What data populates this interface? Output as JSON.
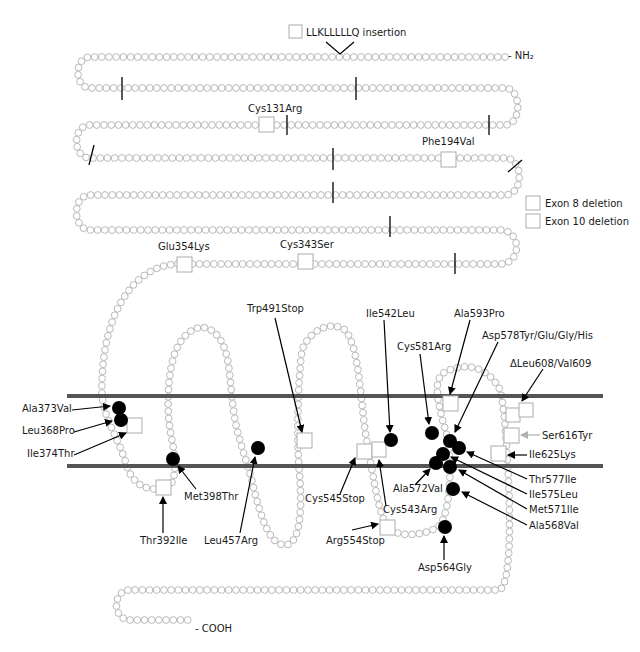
{
  "colors": {
    "bead_stroke": "#b9b9b9",
    "membrane": "#555555",
    "mutation_dot": "#000000",
    "gray_arrow": "#b0b0b0"
  },
  "termini": {
    "n_terminus": "- NH₂",
    "c_terminus": "- COOH"
  },
  "insertion": {
    "label": "LLKLLLLLQ insertion"
  },
  "legend": [
    {
      "label": "Exon 8 deletion"
    },
    {
      "label": "Exon 10 deletion"
    }
  ],
  "extracellular_labels": [
    {
      "label": "Cys131Arg",
      "x": 248,
      "y": 112
    },
    {
      "label": "Phe194Val",
      "x": 422,
      "y": 145
    },
    {
      "label": "Glu354Lys",
      "x": 158,
      "y": 250
    },
    {
      "label": "Cys343Ser",
      "x": 280,
      "y": 248
    }
  ],
  "mutation_labels": [
    {
      "label": "Trp491Stop",
      "x": 247,
      "y": 312
    },
    {
      "label": "Ile542Leu",
      "x": 366,
      "y": 317
    },
    {
      "label": "Ala593Pro",
      "x": 454,
      "y": 317
    },
    {
      "label": "Asp578Tyr/Glu/Gly/His",
      "x": 482,
      "y": 339
    },
    {
      "label": "Cys581Arg",
      "x": 397,
      "y": 350
    },
    {
      "label": "ΔLeu608/Val609",
      "x": 510,
      "y": 367
    },
    {
      "label": "Ala373Val",
      "x": 22,
      "y": 412
    },
    {
      "label": "Leu368Pro",
      "x": 22,
      "y": 434
    },
    {
      "label": "Ile374Thr",
      "x": 27,
      "y": 457
    },
    {
      "label": "Ser616Tyr",
      "x": 542,
      "y": 439
    },
    {
      "label": "Ile625Lys",
      "x": 529,
      "y": 458
    },
    {
      "label": "Thr577Ile",
      "x": 529,
      "y": 483
    },
    {
      "label": "Ile575Leu",
      "x": 529,
      "y": 498
    },
    {
      "label": "Met571Ile",
      "x": 529,
      "y": 513
    },
    {
      "label": "Ala568Val",
      "x": 529,
      "y": 529
    },
    {
      "label": "Met398Thr",
      "x": 184,
      "y": 500
    },
    {
      "label": "Ala572Val",
      "x": 393,
      "y": 492
    },
    {
      "label": "Cys545Stop",
      "x": 305,
      "y": 502
    },
    {
      "label": "Cys543Arg",
      "x": 383,
      "y": 513
    },
    {
      "label": "Thr392Ile",
      "x": 140,
      "y": 544
    },
    {
      "label": "Leu457Arg",
      "x": 204,
      "y": 544
    },
    {
      "label": "Arg554Stop",
      "x": 326,
      "y": 544
    },
    {
      "label": "Asp564Gly",
      "x": 418,
      "y": 571
    }
  ]
}
